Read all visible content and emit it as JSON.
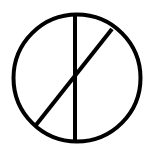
{
  "diagram": {
    "symbol": "circle-with-vertical-and-diagonal-line",
    "stroke_color": "#000000",
    "background": "#ffffff",
    "stroke_width": 4,
    "circle": {
      "cx": 77,
      "cy": 78,
      "r": 63.5
    },
    "vertical_line": {
      "x1": 75,
      "y1": 15,
      "x2": 75,
      "y2": 141
    },
    "diagonal_line": {
      "x1": 36,
      "y1": 125,
      "x2": 112,
      "y2": 29
    }
  }
}
